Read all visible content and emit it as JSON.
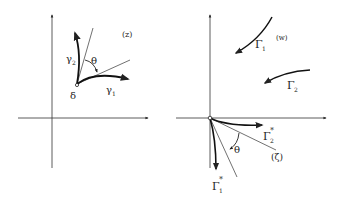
{
  "diagram": {
    "left_panel": {
      "plane_label": "(z)",
      "point_label": "δ",
      "curve1_label": "γ",
      "curve1_sub": "1",
      "curve2_label": "γ",
      "curve2_sub": "2",
      "angle_label": "θ"
    },
    "right_panel": {
      "plane_label_w": "(w)",
      "plane_label_zeta": "(ζ)",
      "curve1_label": "Γ",
      "curve1_sub": "1",
      "curve2_label": "Γ",
      "curve2_sub": "2",
      "curve1_star_label": "Γ",
      "curve1_star_sub": "1",
      "curve2_star_label": "Γ",
      "curve2_star_sub": "2",
      "star": "*",
      "angle_label": "θ"
    },
    "colors": {
      "ink": "#222222",
      "background": "#ffffff"
    }
  }
}
